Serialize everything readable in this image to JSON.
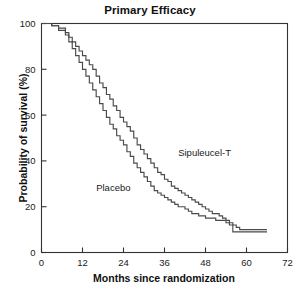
{
  "chart_data": {
    "type": "line",
    "title": "Primary Efficacy",
    "xlabel": "Months since randomization",
    "ylabel": "Probability of survival (%)",
    "xlim": [
      0,
      72
    ],
    "ylim": [
      0,
      100
    ],
    "xticks": [
      0,
      12,
      24,
      36,
      48,
      60,
      72
    ],
    "yticks": [
      0,
      20,
      40,
      60,
      80,
      100
    ],
    "xtick_labels": [
      "0",
      "12",
      "24",
      "36",
      "48",
      "60",
      "72"
    ],
    "ytick_labels": [
      "0",
      "20",
      "40",
      "60",
      "80",
      "100"
    ],
    "grid": false,
    "legend_position": "inline-annotations",
    "line_color": "#4a4a4a",
    "frame_color": "#333333",
    "background": "#ffffff",
    "series": [
      {
        "name": "Sipuleucel-T",
        "label_x": 40,
        "label_y": 42,
        "x": [
          0,
          3,
          5,
          7,
          8,
          9,
          10,
          11,
          12,
          13,
          14,
          15,
          16,
          17,
          18,
          19,
          20,
          21,
          22,
          23,
          24,
          25,
          26,
          27,
          28,
          29,
          30,
          31,
          32,
          33,
          34,
          35,
          36,
          37,
          38,
          39,
          40,
          41,
          42,
          43,
          44,
          45,
          46,
          47,
          48,
          49,
          50,
          51,
          52,
          53,
          54,
          55,
          56,
          57,
          58,
          60,
          62,
          64,
          66
        ],
        "y": [
          100,
          99,
          98,
          96,
          94,
          92,
          90,
          88,
          86,
          84,
          82,
          80,
          77,
          74,
          72,
          69,
          67,
          64,
          62,
          59,
          57,
          55,
          53,
          50,
          47,
          45,
          43,
          41,
          39,
          37,
          35,
          34,
          32,
          31,
          29,
          28,
          27,
          26,
          25,
          24,
          23,
          22,
          21,
          20,
          19,
          18,
          17,
          17,
          16,
          15,
          14,
          13,
          12,
          11,
          10,
          10,
          10,
          10,
          10
        ]
      },
      {
        "name": "Placebo",
        "label_x": 16,
        "label_y": 27,
        "x": [
          0,
          3,
          5,
          7,
          8,
          9,
          10,
          11,
          12,
          13,
          14,
          15,
          16,
          17,
          18,
          19,
          20,
          21,
          22,
          23,
          24,
          25,
          26,
          27,
          28,
          29,
          30,
          31,
          32,
          33,
          34,
          35,
          36,
          37,
          38,
          39,
          40,
          41,
          42,
          43,
          44,
          45,
          46,
          47,
          48,
          49,
          50,
          51,
          52,
          53,
          54,
          55,
          56,
          58,
          60,
          62,
          64,
          66
        ],
        "y": [
          100,
          99,
          97,
          95,
          92,
          89,
          86,
          83,
          80,
          77,
          74,
          71,
          68,
          65,
          62,
          59,
          56,
          54,
          51,
          49,
          47,
          44,
          42,
          39,
          37,
          35,
          33,
          31,
          29,
          27,
          26,
          25,
          24,
          23,
          22,
          21,
          20,
          20,
          19,
          18,
          17,
          17,
          16,
          16,
          15,
          15,
          15,
          14,
          14,
          14,
          13,
          12,
          9,
          9,
          9,
          9,
          9,
          9
        ]
      }
    ]
  }
}
